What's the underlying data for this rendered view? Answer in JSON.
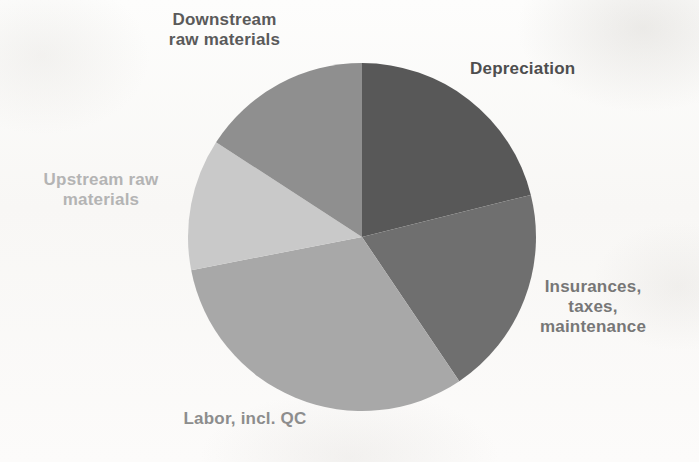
{
  "chart_data": {
    "type": "pie",
    "title": "",
    "legend_position": "callout-labels",
    "grid": false,
    "categories": [
      "Depreciation",
      "Insurances, taxes, maintenance",
      "Labor, incl. QC",
      "Upstream raw materials",
      "Downstream raw materials"
    ],
    "values": [
      21.1,
      19.4,
      31.4,
      12.2,
      15.9
    ],
    "units": "percent",
    "start_angle_deg": 0,
    "direction": "clockwise",
    "slices": [
      {
        "label": "Depreciation",
        "value": 21.1,
        "start_deg": 0,
        "end_deg": 76,
        "color": "#585858",
        "label_color": "#4e4e4e"
      },
      {
        "label": "Insurances,\ntaxes,\nmaintenance",
        "value": 19.4,
        "start_deg": 76,
        "end_deg": 146,
        "color": "#6f6f6f",
        "label_color": "#777777"
      },
      {
        "label": "Labor, incl. QC",
        "value": 31.4,
        "start_deg": 146,
        "end_deg": 259,
        "color": "#a8a8a8",
        "label_color": "#8d8d8d"
      },
      {
        "label": "Upstream raw\nmaterials",
        "value": 12.2,
        "start_deg": 259,
        "end_deg": 303,
        "color": "#c9c9c9",
        "label_color": "#b4b4b4"
      },
      {
        "label": "Downstream\nraw materials",
        "value": 15.9,
        "start_deg": 303,
        "end_deg": 360,
        "color": "#8f8f8f",
        "label_color": "#5a5a5a"
      }
    ]
  },
  "labels": {
    "downstream": "Downstream\nraw materials",
    "depreciation": "Depreciation",
    "upstream": "Upstream raw\nmaterials",
    "insurances": "Insurances,\ntaxes,\nmaintenance",
    "labor": "Labor, incl. QC"
  },
  "geometry": {
    "center_x": 175,
    "center_y": 175,
    "radius": 174
  }
}
